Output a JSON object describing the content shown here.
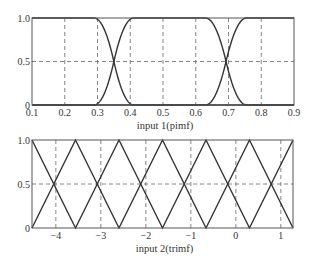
{
  "figure": {
    "width": 315,
    "height": 268,
    "colors": {
      "curve": "#333333",
      "frame": "#555555",
      "grid": "#666666",
      "text": "#333333",
      "background": "#ffffff"
    }
  },
  "chart_data": [
    {
      "id": "top",
      "type": "line",
      "title": "",
      "xlabel": "input 1(pimf)",
      "ylabel": "",
      "xlim": [
        0.1,
        0.9
      ],
      "ylim": [
        0,
        1
      ],
      "grid": true,
      "xticks": [
        0.1,
        0.2,
        0.3,
        0.4,
        0.5,
        0.6,
        0.7,
        0.8,
        0.9
      ],
      "xtick_labels": [
        "0.1",
        "0.2",
        "0.3",
        "0.4",
        "0.5",
        "0.6",
        "0.7",
        "0.8",
        "0.9"
      ],
      "yticks": [
        0,
        0.5,
        1.0
      ],
      "ytick_labels": [
        "0",
        "0.5",
        "1.0"
      ],
      "mf_type": "pimf",
      "series": [
        {
          "name": "mf1",
          "shape": "z",
          "params": [
            0.1,
            0.1,
            0.29,
            0.41
          ]
        },
        {
          "name": "mf2",
          "shape": "pi",
          "params": [
            0.29,
            0.41,
            0.63,
            0.755
          ]
        },
        {
          "name": "mf3",
          "shape": "s",
          "params": [
            0.63,
            0.755,
            0.9,
            0.9
          ]
        }
      ],
      "crossings": [
        {
          "x": 0.35,
          "y": 0.5
        },
        {
          "x": 0.69,
          "y": 0.5
        }
      ],
      "box": {
        "left": 32,
        "top": 18,
        "right": 294,
        "bottom": 105
      }
    },
    {
      "id": "bottom",
      "type": "line",
      "title": "",
      "xlabel": "input 2(trimf)",
      "ylabel": "",
      "xlim": [
        -4.53,
        1.27
      ],
      "ylim": [
        0,
        1
      ],
      "grid": true,
      "xticks": [
        -4,
        -3,
        -2,
        -1,
        0,
        1
      ],
      "xtick_labels": [
        "−4",
        "−3",
        "−2",
        "−1",
        "0",
        "1"
      ],
      "yticks": [
        0,
        0.5,
        1.0
      ],
      "ytick_labels": [
        "0",
        "0.5",
        "1.0"
      ],
      "mf_type": "trimf",
      "vertices_x": [
        -4.53,
        -3.563,
        -2.597,
        -1.63,
        -0.663,
        0.303,
        1.27
      ],
      "series": [
        {
          "name": "family A",
          "x": [
            -4.53,
            -3.563,
            -2.597,
            -1.63,
            -0.663,
            0.303,
            1.27
          ],
          "y": [
            1,
            0,
            1,
            0,
            1,
            0,
            1
          ]
        },
        {
          "name": "family B",
          "x": [
            -4.53,
            -3.563,
            -2.597,
            -1.63,
            -0.663,
            0.303,
            1.27
          ],
          "y": [
            0,
            1,
            0,
            1,
            0,
            1,
            0
          ]
        }
      ],
      "crossings": [
        {
          "x": -4.05,
          "y": 0.5
        },
        {
          "x": -3.08,
          "y": 0.5
        },
        {
          "x": -2.11,
          "y": 0.5
        },
        {
          "x": -1.15,
          "y": 0.5
        },
        {
          "x": -0.18,
          "y": 0.5
        },
        {
          "x": 0.79,
          "y": 0.5
        }
      ],
      "box": {
        "left": 32,
        "top": 140,
        "right": 293,
        "bottom": 228
      }
    }
  ]
}
